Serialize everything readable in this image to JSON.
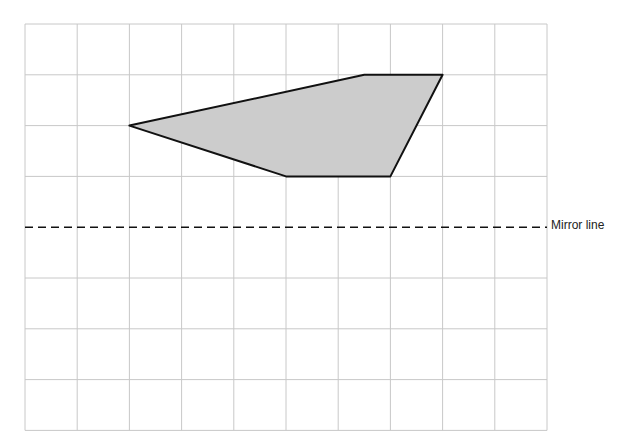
{
  "diagram": {
    "type": "reflection-grid",
    "grid": {
      "columns": 10,
      "rows": 8,
      "left": 25,
      "top": 24,
      "cell_w": 52.2,
      "cell_h": 50.8,
      "line_color": "#c8c8c8"
    },
    "shape": {
      "fill": "#cccccc",
      "stroke": "#111111",
      "vertices_grid": [
        [
          2,
          2
        ],
        [
          6.5,
          1
        ],
        [
          8,
          1
        ],
        [
          7,
          3
        ],
        [
          5,
          3
        ]
      ]
    },
    "mirror_line": {
      "label": "Mirror line",
      "grid_row": 4,
      "style": "dashed"
    }
  }
}
